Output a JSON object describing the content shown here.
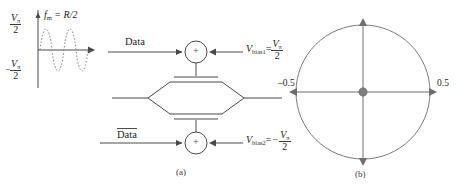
{
  "figure": {
    "panel_a": {
      "caption": "(a)",
      "waveform": {
        "title_f": "f",
        "title_sub": "m",
        "title_eq": " = R/2",
        "y_top_num": "V",
        "y_top_sub": "π",
        "y_top_den": "2",
        "y_bot_sign": "−",
        "y_bot_num": "V",
        "y_bot_sub": "π",
        "y_bot_den": "2",
        "style": "dotted-sine",
        "cycles": 2
      },
      "top_branch": {
        "input_label": "Data",
        "adder_symbol": "+",
        "bias_name": "V",
        "bias_sub": "bias1",
        "bias_eq": "=",
        "bias_num": "V",
        "bias_num_sub": "π",
        "bias_den": "2"
      },
      "bottom_branch": {
        "input_label": "Data",
        "input_overline": true,
        "adder_symbol": "+",
        "bias_name": "V",
        "bias_sub": "bias2",
        "bias_eq": "=",
        "bias_sign": "−",
        "bias_num": "V",
        "bias_num_sub": "π",
        "bias_den": "2"
      },
      "modulator": "mach-zehnder-hexagon"
    },
    "panel_b": {
      "caption": "(b)",
      "left_label": "–0.5",
      "right_label": "0.5",
      "center_dot": true
    }
  },
  "colors": {
    "line": "#4a4a4a",
    "text": "#231f20",
    "dot": "#7d7d7d",
    "dotted": "#8a8a8a"
  }
}
